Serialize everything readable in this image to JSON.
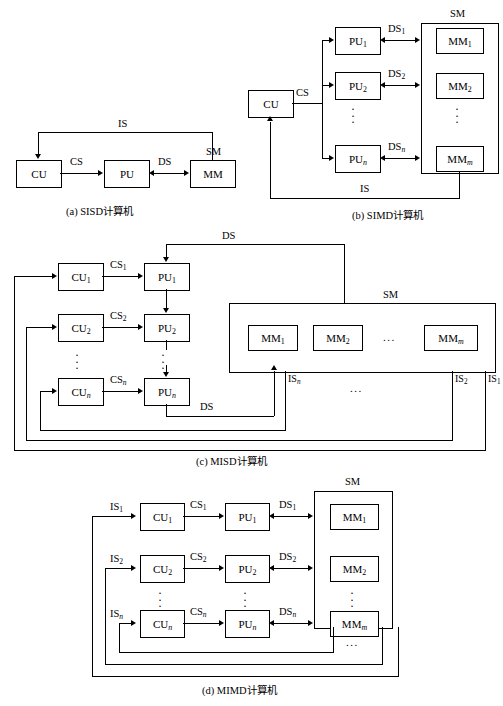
{
  "figure": {
    "panels": [
      {
        "id": "a",
        "caption": "(a) SISD计算机",
        "nodes": [
          {
            "name": "cu",
            "label": "CU"
          },
          {
            "name": "pu",
            "label": "PU"
          },
          {
            "name": "mm",
            "label": "MM"
          }
        ],
        "edge_labels": {
          "cs": "CS",
          "ds": "DS",
          "is": "IS"
        },
        "group_label": "SM"
      },
      {
        "id": "b",
        "caption": "(b) SIMD计算机",
        "cu": "CU",
        "cs": "CS",
        "is": "IS",
        "group_label": "SM",
        "pus": [
          "PU",
          "PU",
          "PU"
        ],
        "pu_subs": [
          "1",
          "2",
          "n"
        ],
        "ds": [
          "DS",
          "DS",
          "DS"
        ],
        "ds_subs": [
          "1",
          "2",
          "n"
        ],
        "mms": [
          "MM",
          "MM",
          "MM"
        ],
        "mm_subs": [
          "1",
          "2",
          "m"
        ],
        "vdots": "⋮"
      },
      {
        "id": "c",
        "caption": "(c) MISD计算机",
        "group_label": "SM",
        "ds_top": "DS",
        "ds_bottom": "DS",
        "cus": [
          "CU",
          "CU",
          "CU"
        ],
        "cu_subs": [
          "1",
          "2",
          "n"
        ],
        "cs": [
          "CS",
          "CS",
          "CS"
        ],
        "cs_subs": [
          "1",
          "2",
          "n"
        ],
        "pus": [
          "PU",
          "PU",
          "PU"
        ],
        "pu_subs": [
          "1",
          "2",
          "n"
        ],
        "mms": [
          "MM",
          "MM",
          "MM"
        ],
        "mm_subs": [
          "1",
          "2",
          "m"
        ],
        "mm_ellipsis": "...",
        "is_labels": [
          "IS",
          "IS",
          "IS"
        ],
        "is_subs": [
          "n",
          "2",
          "1"
        ],
        "is_ellipsis": "...",
        "vdots": "⋮"
      },
      {
        "id": "d",
        "caption": "(d) MIMD计算机",
        "group_label": "SM",
        "is_labels": [
          "IS",
          "IS",
          "IS"
        ],
        "is_subs": [
          "1",
          "2",
          "n"
        ],
        "cus": [
          "CU",
          "CU",
          "CU"
        ],
        "cu_subs": [
          "1",
          "2",
          "n"
        ],
        "cs": [
          "CS",
          "CS",
          "CS"
        ],
        "cs_subs": [
          "1",
          "2",
          "n"
        ],
        "pus": [
          "PU",
          "PU",
          "PU"
        ],
        "pu_subs": [
          "1",
          "2",
          "n"
        ],
        "ds": [
          "DS",
          "DS",
          "DS"
        ],
        "ds_subs": [
          "1",
          "2",
          "n"
        ],
        "mms": [
          "MM",
          "MM",
          "MM"
        ],
        "mm_subs": [
          "1",
          "2",
          "m"
        ],
        "bottom_ellipsis": "...",
        "vdots": "⋮"
      }
    ]
  }
}
